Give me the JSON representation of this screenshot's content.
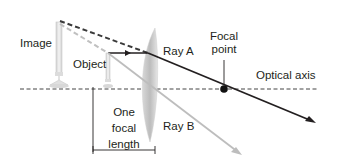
{
  "diagram": {
    "labels": {
      "image": "Image",
      "object": "Object",
      "ray_a": "Ray A",
      "ray_b": "Ray B",
      "focal_point_line1": "Focal",
      "focal_point_line2": "point",
      "optical_axis": "Optical axis",
      "focal_length_line1": "One",
      "focal_length_line2": "focal",
      "focal_length_line3": "length"
    },
    "colors": {
      "ray_a": "#231f20",
      "ray_b": "#bdbdbd",
      "virtual_ray_dark": "#3a3a3a",
      "virtual_ray_light": "#c0c0c0",
      "lens": "#c8c8c8",
      "axis": "#444444",
      "candle": "#e0e0e0"
    }
  }
}
